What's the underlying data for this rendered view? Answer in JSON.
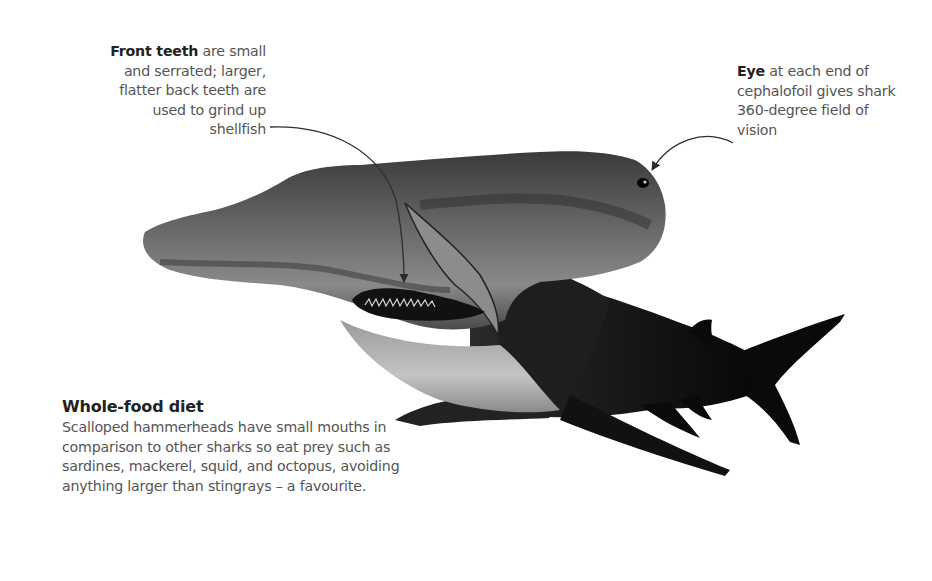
{
  "callouts": {
    "teeth": {
      "label_bold": "Front teeth",
      "text": " are small and serrated; larger, flatter back teeth are used to grind up shellfish"
    },
    "eye": {
      "label_bold": "Eye",
      "text": " at each end of cephalofoil gives shark 360-degree field of vision"
    }
  },
  "diet": {
    "title": "Whole-food diet",
    "body": "Scalloped hammerheads have small mouths in comparison to other sharks so eat prey such as sardines, mackerel, squid, and octopus, avoiding anything larger than stingrays – a favourite."
  },
  "illustration": {
    "subject": "Scalloped hammerhead shark",
    "colors": {
      "body_dark": "#1a1a1a",
      "body_mid": "#5a5a5a",
      "belly_light": "#b8b8b8",
      "leader_line": "#3a3a3a"
    }
  }
}
